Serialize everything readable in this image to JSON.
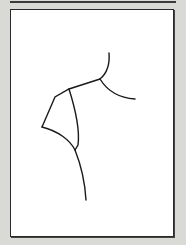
{
  "figure": {
    "colors": {
      "background": "#d9d9d6",
      "panel": "#ffffff",
      "stroke": "#1a1a1a"
    }
  }
}
